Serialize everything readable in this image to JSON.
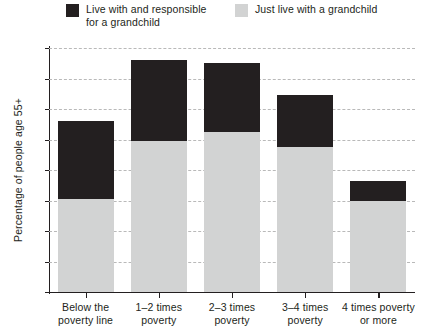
{
  "chart_data": {
    "type": "bar",
    "title": "",
    "subtitle": "",
    "xlabel": "",
    "ylabel": "Percentage of people age 55+",
    "ylim": [
      0,
      8
    ],
    "yticks": [
      0,
      1,
      2,
      3,
      4,
      5,
      6,
      7,
      8
    ],
    "grid": true,
    "stacked": true,
    "legend_position": "top",
    "categories": [
      "Below the\npoverty line",
      "1–2 times\npoverty",
      "2–3 times\npoverty",
      "3–4 times\npoverty",
      "4 times poverty\nor more"
    ],
    "series": [
      {
        "name": "Just live with a grandchild",
        "color": "#d2d3d3",
        "values": [
          3.05,
          4.95,
          5.25,
          4.75,
          3.0
        ]
      },
      {
        "name": "Live with and responsible\nfor a grandchild",
        "color": "#231f20",
        "values": [
          2.55,
          2.65,
          2.25,
          1.7,
          0.65
        ]
      }
    ],
    "totals": [
      5.6,
      7.6,
      7.5,
      6.45,
      3.65
    ]
  },
  "legend": {
    "items": [
      {
        "label": "Live with and responsible\nfor a grandchild",
        "color": "#231f20",
        "swatch_name": "legend-swatch-dark"
      },
      {
        "label": "Just live with a grandchild",
        "color": "#d2d3d3",
        "swatch_name": "legend-swatch-light"
      }
    ]
  },
  "axes": {
    "y_title": "Percentage of people age 55+",
    "y_tick_labels": [
      "0",
      "1",
      "2",
      "3",
      "4",
      "5",
      "6",
      "7",
      "8"
    ],
    "x_tick_labels": [
      "Below the\npoverty line",
      "1–2 times\npoverty",
      "2–3 times\npoverty",
      "3–4 times\npoverty",
      "4 times poverty\nor more"
    ]
  },
  "colors": {
    "dark": "#231f20",
    "light": "#d2d3d3",
    "grid": "#b9b9b9",
    "background": "#ffffff"
  }
}
